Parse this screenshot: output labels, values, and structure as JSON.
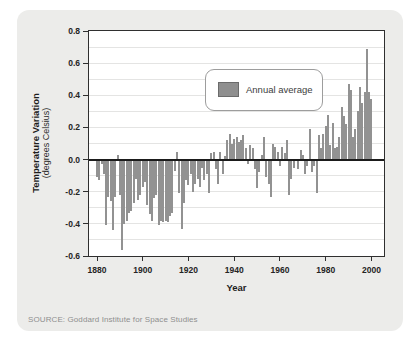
{
  "source_line": "SOURCE: Goddard Institute for Space Studies",
  "colors": {
    "card_bg": "#ececea",
    "plot_bg": "#ffffff",
    "bar": "#929292",
    "zero_line": "#1b1b1b",
    "gridline": "#e4e4e3",
    "frame": "#2f2f2f"
  },
  "chart_data": {
    "type": "bar",
    "title": "",
    "xlabel": "Year",
    "ylabel": "Temperature Variation",
    "ylabel_sub": "(degrees Celsius)",
    "legend_label": "Annual average",
    "legend_position": "upper-left-inside",
    "grid": "faint horizontal lines every 0.1",
    "ylim": [
      -0.6,
      0.8
    ],
    "xlim": [
      1876.5,
      2005.5
    ],
    "yticks": [
      "0.8",
      "0.6",
      "0.4",
      "0.2",
      "0.0",
      "-0.2",
      "-0.4",
      "-0.6"
    ],
    "ytick_values": [
      0.8,
      0.6,
      0.4,
      0.2,
      0.0,
      -0.2,
      -0.4,
      -0.6
    ],
    "xticks": [
      1880,
      1900,
      1920,
      1940,
      1960,
      1980,
      2000
    ],
    "year_start": 1880,
    "year_end": 2000,
    "values": [
      -0.11,
      -0.13,
      -0.03,
      -0.09,
      -0.41,
      -0.23,
      -0.26,
      -0.44,
      -0.23,
      0.03,
      -0.22,
      -0.56,
      -0.4,
      -0.38,
      -0.33,
      -0.32,
      -0.27,
      -0.12,
      -0.25,
      -0.22,
      -0.17,
      -0.14,
      -0.28,
      -0.34,
      -0.38,
      -0.24,
      -0.22,
      -0.41,
      -0.38,
      -0.39,
      -0.38,
      -0.39,
      -0.35,
      -0.33,
      -0.07,
      0.05,
      -0.21,
      -0.43,
      -0.27,
      -0.13,
      -0.16,
      -0.09,
      -0.2,
      -0.15,
      -0.12,
      -0.17,
      -0.05,
      -0.13,
      -0.09,
      -0.21,
      0.04,
      0.05,
      -0.06,
      -0.15,
      0.05,
      -0.09,
      0.02,
      0.12,
      0.16,
      0.1,
      0.13,
      0.14,
      0.11,
      0.12,
      0.15,
      0.07,
      -0.03,
      0.09,
      0.07,
      -0.06,
      -0.18,
      -0.08,
      0.03,
      0.14,
      -0.11,
      -0.15,
      -0.23,
      0.1,
      0.08,
      0.05,
      -0.04,
      0.08,
      0.04,
      0.12,
      -0.22,
      -0.12,
      -0.05,
      0.0,
      -0.06,
      0.06,
      0.03,
      -0.09,
      -0.04,
      0.19,
      -0.08,
      -0.04,
      -0.21,
      0.15,
      0.07,
      0.16,
      0.21,
      0.28,
      0.09,
      0.23,
      0.07,
      0.08,
      0.14,
      0.33,
      0.27,
      0.22,
      0.47,
      0.43,
      0.14,
      0.19,
      0.3,
      0.45,
      0.35,
      0.42,
      0.69,
      0.42,
      0.38
    ]
  }
}
